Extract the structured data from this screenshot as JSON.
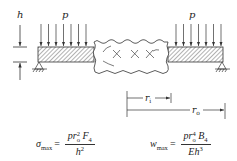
{
  "diagram": {
    "type": "annular plate / beam cross-section under uniform pressure",
    "labels": {
      "thickness": "h",
      "load_left": "p",
      "load_right": "p",
      "inner_radius": "r",
      "inner_radius_sub": "i",
      "outer_radius": "r",
      "outer_radius_sub": "o"
    },
    "colors": {
      "line": "#333333",
      "hatch": "#555555",
      "background": "#ffffff"
    },
    "arrow_count_per_side": 7
  },
  "formulas": {
    "stress": {
      "lhs": "σ",
      "lhs_sub": "max",
      "eq": "=",
      "num_p": "p",
      "num_r": "r",
      "num_r_sub": "o",
      "num_r_sup": "2",
      "num_coef": "F",
      "num_coef_sub": "4",
      "den_base": "h",
      "den_sup": "2"
    },
    "deflection": {
      "lhs": "w",
      "lhs_sub": "max",
      "eq": "=",
      "num_p": "p",
      "num_r": "r",
      "num_r_sub": "o",
      "num_r_sup": "4",
      "num_coef": "B",
      "num_coef_sub": "4",
      "den_E": "E",
      "den_base": "h",
      "den_sup": "3"
    }
  }
}
